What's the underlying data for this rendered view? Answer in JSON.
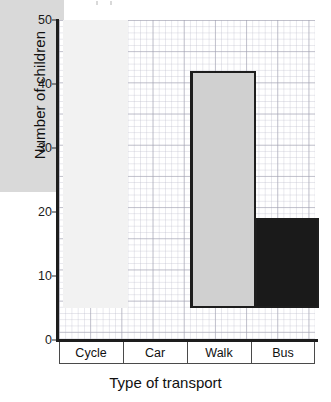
{
  "chart_data": {
    "type": "bar",
    "title": "",
    "xlabel": "Type of transport",
    "ylabel": "Number of children",
    "categories": [
      "Cycle",
      "Car",
      "Walk",
      "Bus"
    ],
    "values": [
      30,
      45,
      37,
      14
    ],
    "ylim": [
      0,
      50
    ],
    "y_ticks": [
      0,
      10,
      20,
      30,
      40,
      50
    ],
    "y_tick_labels": [
      "0",
      "10",
      "20",
      "30",
      "40",
      "50"
    ],
    "grid": true,
    "grid_style": "graph-paper",
    "legend": "none",
    "bar_colors": [
      "#d9d9d9",
      "#f2f2f2",
      "#d0d0d0",
      "#1a1a1a"
    ],
    "bar_edge_color": "#1d1d1d",
    "axis_color": "#1d1d1d"
  },
  "axes": {
    "y_title": "Number of children",
    "x_title": "Type of transport",
    "ticks": [
      {
        "label": "50",
        "value": 50
      },
      {
        "label": "40",
        "value": 40
      },
      {
        "label": "30",
        "value": 30
      },
      {
        "label": "20",
        "value": 20
      },
      {
        "label": "10",
        "value": 10
      },
      {
        "label": "0",
        "value": 0
      }
    ]
  },
  "bars": [
    {
      "label": "Cycle",
      "value": 30,
      "color": "#d9d9d9"
    },
    {
      "label": "Car",
      "value": 45,
      "color": "#f2f2f2"
    },
    {
      "label": "Walk",
      "value": 37,
      "color": "#d0d0d0"
    },
    {
      "label": "Bus",
      "value": 14,
      "color": "#1a1a1a"
    }
  ]
}
